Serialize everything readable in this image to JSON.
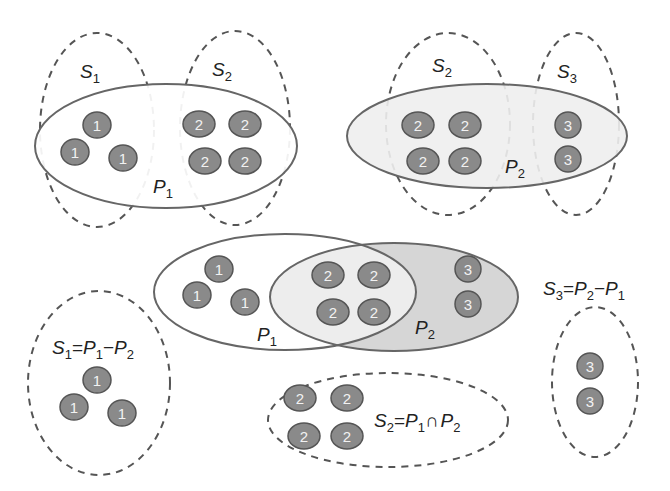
{
  "diagram": {
    "colors": {
      "ball_fill": "#8a8a8a",
      "ball_stroke": "#555555",
      "p1_fill": "#ffffff",
      "p2_fill_light": "#efefef",
      "p2_fill_dark": "#d4d4d4",
      "intersection_fill": "#ececec",
      "line": "#666666"
    },
    "top_left": {
      "s1_label": "S",
      "s1_sub": "1",
      "s2_label": "S",
      "s2_sub": "2",
      "p1_label": "P",
      "p1_sub": "1",
      "balls": [
        "1",
        "1",
        "1",
        "2",
        "2",
        "2",
        "2"
      ]
    },
    "top_right": {
      "s2_label": "S",
      "s2_sub": "2",
      "s3_label": "S",
      "s3_sub": "3",
      "p2_label": "P",
      "p2_sub": "2",
      "balls": [
        "2",
        "2",
        "2",
        "2",
        "3",
        "3"
      ]
    },
    "middle": {
      "p1_label": "P",
      "p1_sub": "1",
      "p2_label": "P",
      "p2_sub": "2",
      "balls": [
        "1",
        "1",
        "1",
        "2",
        "2",
        "2",
        "2",
        "3",
        "3"
      ]
    },
    "bottom_left": {
      "formula": {
        "lhs": "S",
        "lhs_sub": "1",
        "eq": "=",
        "a": "P",
        "a_sub": "1",
        "op": "−",
        "b": "P",
        "b_sub": "2"
      },
      "balls": [
        "1",
        "1",
        "1"
      ]
    },
    "bottom_center": {
      "formula": {
        "lhs": "S",
        "lhs_sub": "2",
        "eq": "=",
        "a": "P",
        "a_sub": "1",
        "op": "∩",
        "b": "P",
        "b_sub": "2"
      },
      "balls": [
        "2",
        "2",
        "2",
        "2"
      ]
    },
    "bottom_right": {
      "formula": {
        "lhs": "S",
        "lhs_sub": "3",
        "eq": "=",
        "a": "P",
        "a_sub": "2",
        "op": "−",
        "b": "P",
        "b_sub": "1"
      },
      "balls": [
        "3",
        "3"
      ]
    }
  }
}
